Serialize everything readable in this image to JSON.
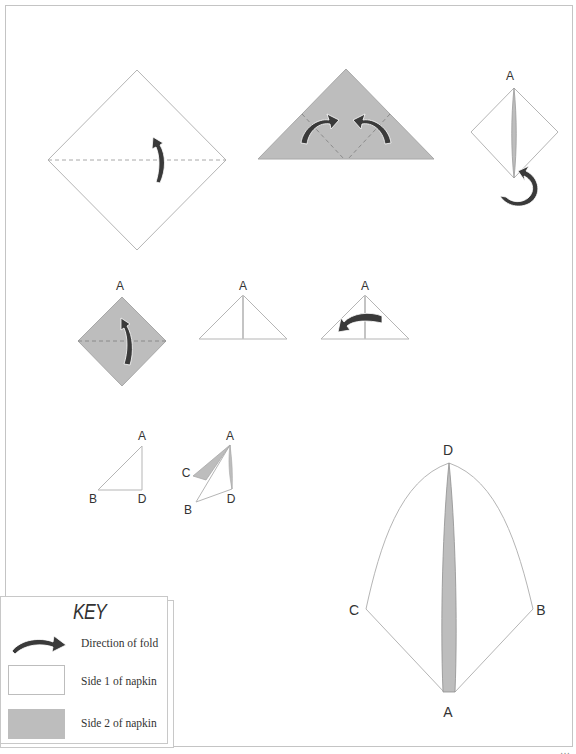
{
  "diagram": {
    "type": "origami napkin folding instructions",
    "colors": {
      "side1": "#ffffff",
      "side2": "#bdbdbd",
      "outline": "#b5b5b5",
      "arrow": "#3a3a3a",
      "fold_line": "#a8a8a8"
    },
    "steps": [
      {
        "id": 1,
        "shape": "square diamond",
        "side": "side1",
        "fold": "horizontal dashed fold, fold up"
      },
      {
        "id": 2,
        "shape": "triangle",
        "side": "side2",
        "fold": "fold left and right corners up to top"
      },
      {
        "id": 3,
        "shape": "diamond",
        "side": "side1",
        "label": "A",
        "fold": "turn over"
      },
      {
        "id": 4,
        "shape": "diamond",
        "side": "side2",
        "label": "A",
        "fold": "fold up along dashed line"
      },
      {
        "id": 5,
        "shape": "triangle",
        "side": "side1",
        "label": "A"
      },
      {
        "id": 6,
        "shape": "triangle",
        "side": "side1",
        "label": "A",
        "fold": "fold right to left"
      },
      {
        "id": 7,
        "shape": "right triangle",
        "side": "side1",
        "labels": [
          "A",
          "B",
          "D"
        ]
      },
      {
        "id": 8,
        "shape": "open triangle",
        "labels": [
          "A",
          "C",
          "B",
          "D"
        ]
      },
      {
        "id": 9,
        "shape": "finished fan",
        "labels": [
          "D",
          "C",
          "B",
          "A"
        ]
      }
    ],
    "labels": {
      "A": "A",
      "B": "B",
      "C": "C",
      "D": "D"
    }
  },
  "key": {
    "title": "KEY",
    "rows": [
      {
        "icon": "fold-arrow-icon",
        "label": "Direction of fold"
      },
      {
        "icon": "side1-swatch",
        "label": "Side 1 of napkin"
      },
      {
        "icon": "side2-swatch",
        "label": "Side 2 of napkin"
      }
    ]
  },
  "footer": {
    "text": "…"
  }
}
